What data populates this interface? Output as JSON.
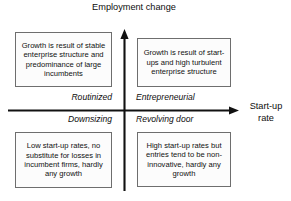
{
  "diagram": {
    "axes": {
      "vertical": {
        "label_line1": "Employment",
        "label_line2": "change",
        "icon": "up-arrow-icon"
      },
      "horizontal": {
        "label_line1": "Start-up",
        "label_line2": "rate",
        "icon": "right-arrow-icon"
      }
    },
    "quadrant_labels": {
      "top_left": "Routinized",
      "top_right": "Entrepreneurial",
      "bottom_left": "Downsizing",
      "bottom_right": "Revolving door"
    },
    "boxes": {
      "top_left": "Growth is result of stable enterprise structure and predominance of large incumbents",
      "top_right": "Growth is result of start-ups and high turbulent enterprise structure",
      "bottom_left": "Low start-up rates, no substitute for losses in incumbent firms, hardly any growth",
      "bottom_right": "High start-up rates but entries tend to be non-innovative, hardly any growth"
    },
    "colors": {
      "line": "#111111",
      "box_border": "#6e6e6e",
      "box_fill": "#fcfcfc",
      "background": "#ffffff",
      "text": "#111111"
    }
  }
}
